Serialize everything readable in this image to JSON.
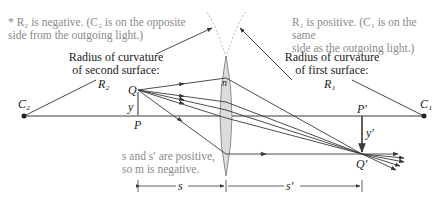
{
  "notes": {
    "r2_note_line1": "* R₂ is negative. (C₂ is on the opposite",
    "r2_note_line2": "side from the outgoing light.)",
    "r1_note_line1": "R₁ is positive. (C₁ is on the same",
    "r1_note_line2": "side as the outgoing light.)",
    "sign_note_line1": "s and s′ are positive,",
    "sign_note_line2": "so m is negative."
  },
  "labels": {
    "second_surface_line1": "Radius of curvature",
    "second_surface_line2": "of second surface:",
    "second_surface_symbol": "R₂",
    "first_surface_line1": "Radius of curvature",
    "first_surface_line2": "of first surface:",
    "first_surface_symbol": "R₁",
    "C2": "C₂",
    "C1": "C₁",
    "Q": "Q",
    "P": "P",
    "y": "y",
    "n": "n",
    "P_prime": "P′",
    "Q_prime": "Q′",
    "y_prime": "y′",
    "s": "s",
    "s_prime": "s′"
  },
  "colors": {
    "line": "#3a3a3a",
    "lens_fill": "#dcdcdc",
    "note_text": "#8a8a8a",
    "dashed_arc": "#9a9a9a"
  }
}
